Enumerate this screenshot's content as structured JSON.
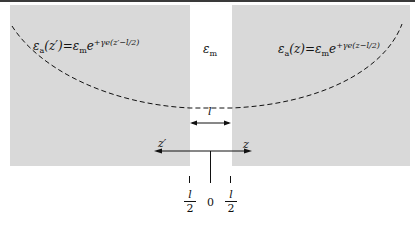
{
  "diagram": {
    "labels": {
      "left_formula_lhs": "ε",
      "left_formula_lhs_sub": "a",
      "left_formula_arg": "(z′)",
      "left_formula_eq": "=ε",
      "left_formula_sub_m": "m",
      "left_formula_e": "e",
      "left_formula_exp": "+γe(z′−l/2)",
      "right_formula_lhs": "ε",
      "right_formula_lhs_sub": "a",
      "right_formula_arg": "(z)",
      "right_formula_eq": "=ε",
      "right_formula_sub_m": "m",
      "right_formula_e": "e",
      "right_formula_exp": "+γe(z−l/2)",
      "center_eps": "ε",
      "center_eps_sub": "m",
      "gap_width": "l",
      "axis_left": "z′",
      "axis_right": "z",
      "tick_left_num": "l",
      "tick_left_den": "2",
      "tick_center": "0",
      "tick_right_num": "l",
      "tick_right_den": "2"
    },
    "colors": {
      "panel": "#d9d9d9",
      "line": "#111111",
      "topbar": "#3a3a3a"
    }
  }
}
